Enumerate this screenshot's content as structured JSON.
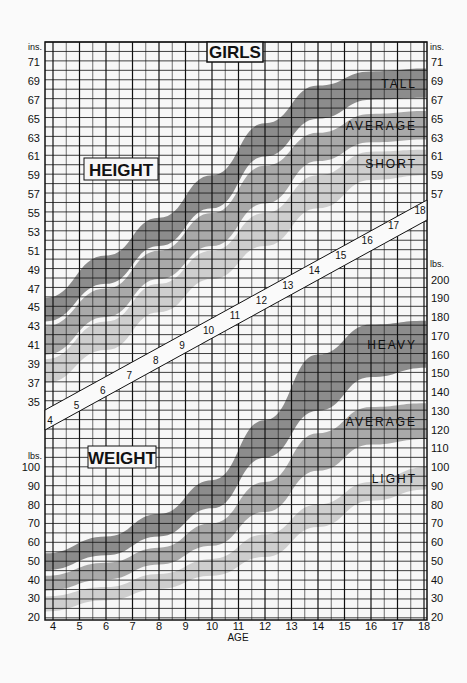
{
  "chart_data": {
    "type": "area",
    "title": "GIRLS",
    "xlabel": "AGE",
    "x_ticks": [
      4,
      5,
      6,
      7,
      8,
      9,
      10,
      11,
      12,
      13,
      14,
      15,
      16,
      17,
      18
    ],
    "x_range": [
      4,
      18
    ],
    "grid": true,
    "panels": [
      {
        "name": "HEIGHT",
        "unit_label": "ins.",
        "ylabel": "Height (in)",
        "y_ticks": [
          71,
          69,
          67,
          65,
          63,
          61,
          59,
          57,
          55,
          53,
          51,
          49,
          47,
          45,
          43,
          41,
          39,
          37,
          35
        ],
        "right_y_ticks": [
          71,
          69,
          67,
          65,
          63,
          61,
          59,
          57
        ],
        "ylim": [
          34,
          72
        ],
        "ages": [
          4,
          6,
          8,
          10,
          12,
          14,
          16,
          18
        ],
        "series": [
          {
            "name": "TALL",
            "color": "#8c8c8c",
            "low": [
              43.5,
              47.5,
              51.5,
              55.5,
              61,
              65,
              67,
              67.2
            ],
            "high": [
              46,
              50.5,
              54.5,
              59,
              64.5,
              68.5,
              70,
              70.3
            ]
          },
          {
            "name": "AVERAGE",
            "color": "#a9a9a9",
            "low": [
              40,
              44,
              48,
              51.5,
              56,
              60.5,
              62.5,
              62.8
            ],
            "high": [
              43,
              47,
              51,
              55,
              60,
              63.5,
              65.5,
              65.8
            ]
          },
          {
            "name": "SHORT",
            "color": "#cecece",
            "low": [
              37,
              40.5,
              44.5,
              48,
              51.5,
              55.5,
              58.5,
              59
            ],
            "high": [
              39.5,
              43.5,
              47.5,
              51,
              55,
              59,
              61.5,
              61.7
            ]
          }
        ]
      },
      {
        "name": "WEIGHT",
        "unit_label": "lbs.",
        "ylabel": "Weight (lbs)",
        "y_ticks": [
          100,
          90,
          80,
          70,
          60,
          50,
          40,
          30,
          20
        ],
        "right_y_ticks": [
          200,
          190,
          180,
          170,
          160,
          150,
          140,
          130,
          120,
          110,
          100,
          90,
          80,
          70,
          60,
          50,
          40,
          30,
          20
        ],
        "ylim": [
          15,
          205
        ],
        "ages": [
          4,
          6,
          8,
          10,
          12,
          14,
          16,
          18
        ],
        "series": [
          {
            "name": "HEAVY",
            "color": "#8c8c8c",
            "low": [
              45,
              53,
              63,
              78,
              105,
              130,
              148,
              153
            ],
            "high": [
              54,
              63,
              75,
              93,
              125,
              160,
              176,
              178
            ]
          },
          {
            "name": "AVERAGE",
            "color": "#a9a9a9",
            "low": [
              34,
              40,
              48,
              58,
              76,
              98,
              112,
              115
            ],
            "high": [
              42,
              49,
              57,
              70,
              92,
              118,
              132,
              134
            ]
          },
          {
            "name": "LIGHT",
            "color": "#cecece",
            "low": [
              23,
              29,
              35,
              42,
              52,
              68,
              82,
              88
            ],
            "high": [
              31,
              36,
              43,
              51,
              64,
              80,
              92,
              100
            ]
          }
        ]
      }
    ],
    "age_band_labels": [
      4,
      5,
      6,
      7,
      8,
      9,
      10,
      11,
      12,
      13,
      14,
      15,
      16,
      17,
      18
    ]
  },
  "labels": {
    "title": "GIRLS",
    "height_panel": "HEIGHT",
    "weight_panel": "WEIGHT",
    "x_axis": "AGE",
    "unit_in_left": "ins.",
    "unit_in_right": "ins.",
    "unit_lb_left": "lbs.",
    "unit_lb_right": "lbs."
  },
  "colors": {
    "grid": "#111111",
    "background": "#f7f7f7",
    "dark": "#8c8c8c",
    "medium": "#a9a9a9",
    "light": "#cecece"
  }
}
